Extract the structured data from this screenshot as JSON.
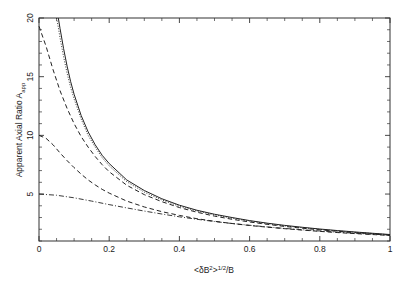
{
  "figure": {
    "background_color": "#ffffff",
    "ink_color": "#222222"
  },
  "axes": {
    "x_title_parts": {
      "open": "<",
      "delta_b": "δB",
      "squared": "2",
      "close": ">",
      "exponent": "1/2",
      "divider": "/B"
    },
    "y_title_main": "Apparent Axial Ratio A",
    "y_title_sub": "app",
    "x_tick_labels": [
      "0",
      "0.2",
      "0.4",
      "0.6",
      "0.8",
      "1"
    ],
    "x_tick_values": [
      0,
      0.2,
      0.4,
      0.6,
      0.8,
      1
    ],
    "y_tick_labels": [
      "5",
      "10",
      "15",
      "20"
    ],
    "y_tick_values": [
      5,
      10,
      15,
      20
    ]
  },
  "chart_data": {
    "type": "line",
    "title": "",
    "subtitle": "",
    "xlabel": "<δB²>^(1/2)/B",
    "ylabel": "Apparent Axial Ratio A_app",
    "xlim": [
      0,
      1
    ],
    "ylim": [
      1,
      20
    ],
    "grid": false,
    "legend": "none",
    "x_tick_values": [
      0,
      0.2,
      0.4,
      0.6,
      0.8,
      1
    ],
    "y_tick_values": [
      5,
      10,
      15,
      20
    ],
    "x_minor_tick_step": 0.05,
    "y_minor_tick_step": 1,
    "series": [
      {
        "name": "solid",
        "style": "solid",
        "note": "rises off scale above 20 near x=0.055",
        "x": [
          0.055,
          0.06,
          0.07,
          0.08,
          0.09,
          0.1,
          0.12,
          0.14,
          0.16,
          0.18,
          0.2,
          0.25,
          0.3,
          0.35,
          0.4,
          0.45,
          0.5,
          0.55,
          0.6,
          0.65,
          0.7,
          0.75,
          0.8,
          0.85,
          0.9,
          0.95,
          1.0
        ],
        "y": [
          20.0,
          19.1,
          17.4,
          15.9,
          14.6,
          13.5,
          11.7,
          10.3,
          9.2,
          8.3,
          7.6,
          6.2,
          5.3,
          4.6,
          4.05,
          3.62,
          3.28,
          3.0,
          2.74,
          2.52,
          2.33,
          2.17,
          2.02,
          1.89,
          1.77,
          1.66,
          1.55
        ]
      },
      {
        "name": "dotted",
        "style": "dotted",
        "note": "nearly coincident with solid, slightly to the left",
        "x": [
          0.05,
          0.055,
          0.06,
          0.07,
          0.08,
          0.09,
          0.1,
          0.12,
          0.14,
          0.16,
          0.18,
          0.2,
          0.25,
          0.3,
          0.35,
          0.4,
          0.45,
          0.5,
          0.55,
          0.6,
          0.65,
          0.7,
          0.75,
          0.8,
          0.85,
          0.9,
          0.95,
          1.0
        ],
        "y": [
          20.0,
          19.2,
          18.3,
          16.7,
          15.3,
          14.1,
          13.1,
          11.4,
          10.0,
          9.0,
          8.1,
          7.4,
          6.05,
          5.16,
          4.5,
          3.96,
          3.55,
          3.22,
          2.94,
          2.69,
          2.48,
          2.29,
          2.13,
          1.99,
          1.86,
          1.74,
          1.64,
          1.53
        ]
      },
      {
        "name": "dashed-upper",
        "style": "dashed",
        "x": [
          0.0,
          0.02,
          0.04,
          0.06,
          0.08,
          0.1,
          0.12,
          0.14,
          0.16,
          0.18,
          0.2,
          0.25,
          0.3,
          0.35,
          0.4,
          0.45,
          0.5,
          0.55,
          0.6,
          0.65,
          0.7,
          0.75,
          0.8,
          0.85,
          0.9,
          0.95,
          1.0
        ],
        "y": [
          19.3,
          17.6,
          15.6,
          13.8,
          12.3,
          11.0,
          9.9,
          9.0,
          8.2,
          7.5,
          6.9,
          5.75,
          4.95,
          4.35,
          3.85,
          3.45,
          3.12,
          2.85,
          2.62,
          2.42,
          2.24,
          2.09,
          1.95,
          1.83,
          1.71,
          1.61,
          1.5
        ]
      },
      {
        "name": "dashed-lower",
        "style": "dashed",
        "x": [
          0.0,
          0.02,
          0.04,
          0.06,
          0.08,
          0.1,
          0.12,
          0.14,
          0.16,
          0.18,
          0.2,
          0.25,
          0.3,
          0.35,
          0.4,
          0.45,
          0.5,
          0.55,
          0.6,
          0.65,
          0.7,
          0.75,
          0.8,
          0.85,
          0.9,
          0.95,
          1.0
        ],
        "y": [
          10.0,
          9.75,
          9.2,
          8.5,
          7.85,
          7.25,
          6.7,
          6.2,
          5.78,
          5.4,
          5.08,
          4.4,
          3.9,
          3.5,
          3.18,
          2.9,
          2.68,
          2.49,
          2.32,
          2.18,
          2.05,
          1.93,
          1.82,
          1.72,
          1.63,
          1.55,
          1.47
        ]
      },
      {
        "name": "dash-dot",
        "style": "dashdot",
        "x": [
          0.0,
          0.05,
          0.1,
          0.15,
          0.2,
          0.25,
          0.3,
          0.35,
          0.4,
          0.45,
          0.5,
          0.55,
          0.6,
          0.65,
          0.7,
          0.75,
          0.8,
          0.85,
          0.9,
          0.95,
          1.0
        ],
        "y": [
          5.0,
          4.9,
          4.68,
          4.4,
          4.1,
          3.82,
          3.55,
          3.3,
          3.06,
          2.85,
          2.66,
          2.49,
          2.34,
          2.2,
          2.07,
          1.96,
          1.85,
          1.75,
          1.66,
          1.58,
          1.5
        ]
      }
    ]
  }
}
